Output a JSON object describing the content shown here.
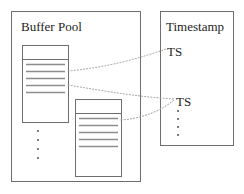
{
  "diagram": {
    "title_visible": false,
    "background_color": "#ffffff",
    "outline_color": "#6e6e6e",
    "line_color": "#8d8d8d",
    "connector_color": "#9a9a9a",
    "text_color": "#1d1d1d",
    "containers": [
      {
        "id": "buffer-pool",
        "label": "Buffer Pool",
        "x": 11,
        "y": 11,
        "width": 129,
        "height": 170
      },
      {
        "id": "timestamp",
        "label": "Timestamp",
        "x": 160,
        "y": 11,
        "width": 73,
        "height": 134
      }
    ],
    "pages": [
      {
        "id": "page-1",
        "x": 22,
        "y": 45,
        "width": 46,
        "height": 77,
        "header_height": 14,
        "line_count": 5
      },
      {
        "id": "page-2",
        "x": 75,
        "y": 99,
        "width": 46,
        "height": 77,
        "header_height": 14,
        "line_count": 5
      }
    ],
    "timestamp_entries": [
      {
        "id": "ts-1",
        "label": "TS",
        "x": 167,
        "y": 51
      },
      {
        "id": "ts-2",
        "label": "TS",
        "x": 176,
        "y": 101
      }
    ],
    "ellipses": [
      {
        "id": "buffer-pool-ellipsis",
        "dot_count": 4,
        "x": 38,
        "y_start": 130,
        "spacing": 9
      },
      {
        "id": "timestamp-ellipsis",
        "dot_count": 4,
        "x": 177,
        "y_start": 110,
        "spacing": 8
      }
    ],
    "connectors": [
      {
        "id": "connector-page1-ts1",
        "from": "page-1",
        "to": "ts-1",
        "path": "M 68 71 C 110 67, 140 58, 166 49"
      },
      {
        "id": "connector-page1-ts2",
        "from": "page-1",
        "to": "ts-2",
        "path": "M 68 85 C 110 92, 140 97, 174 99"
      },
      {
        "id": "connector-page2-ts2",
        "from": "page-2",
        "to": "ts-2",
        "path": "M 121 120 C 145 118, 162 110, 174 100"
      }
    ]
  }
}
